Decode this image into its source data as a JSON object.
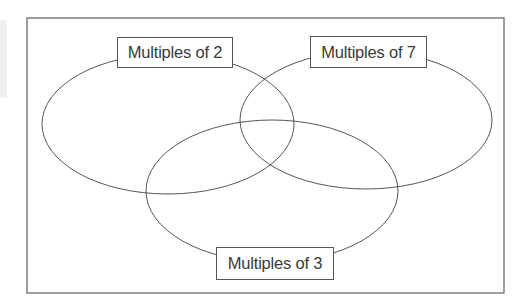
{
  "diagram": {
    "type": "venn",
    "sets": [
      {
        "id": "set-2",
        "label": "Multiples of 2"
      },
      {
        "id": "set-7",
        "label": "Multiples of 7"
      },
      {
        "id": "set-3",
        "label": "Multiples of 3"
      }
    ],
    "colors": {
      "outline": "#555555",
      "text": "#3a3a3a",
      "background": "#ffffff"
    }
  }
}
